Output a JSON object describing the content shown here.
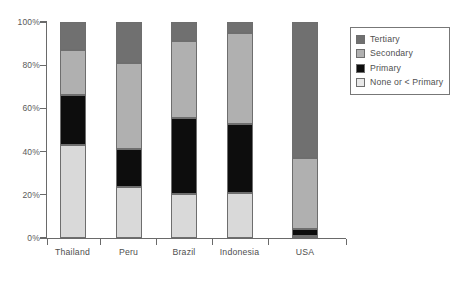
{
  "chart_data": {
    "type": "bar",
    "subtype": "stacked-100-percent",
    "title": "",
    "subtitle": "",
    "xlabel": "",
    "ylabel": "",
    "categories": [
      "Thailand",
      "Peru",
      "Brazil",
      "Indonesia",
      "USA"
    ],
    "ytick_labels": [
      "0%",
      "20%",
      "40%",
      "60%",
      "80%",
      "100%"
    ],
    "ytick_values": [
      0,
      20,
      40,
      60,
      80,
      100
    ],
    "ylim": [
      0,
      100
    ],
    "grid": false,
    "legend_position": "right-top",
    "series": [
      {
        "name": "None or < Primary",
        "color": "#d9d9d9",
        "values": [
          43.0,
          23.5,
          20.5,
          21.0,
          1.0
        ]
      },
      {
        "name": "Primary",
        "color": "#0d0d0d",
        "values": [
          23.0,
          17.5,
          35.0,
          32.0,
          3.0
        ]
      },
      {
        "name": "Secondary",
        "color": "#b0b0b0",
        "values": [
          21.0,
          40.0,
          35.5,
          42.0,
          33.0
        ]
      },
      {
        "name": "Tertiary",
        "color": "#707070",
        "values": [
          13.0,
          19.0,
          9.0,
          5.0,
          63.0
        ]
      }
    ],
    "legend_entries": [
      {
        "label": "Tertiary",
        "color": "#707070"
      },
      {
        "label": "Secondary",
        "color": "#b0b0b0"
      },
      {
        "label": "Primary",
        "color": "#0d0d0d"
      },
      {
        "label": "None or < Primary",
        "color": "#e8e8e8"
      }
    ],
    "axis_color": "#6a6a6a",
    "text_color": "#4f4f4f"
  }
}
